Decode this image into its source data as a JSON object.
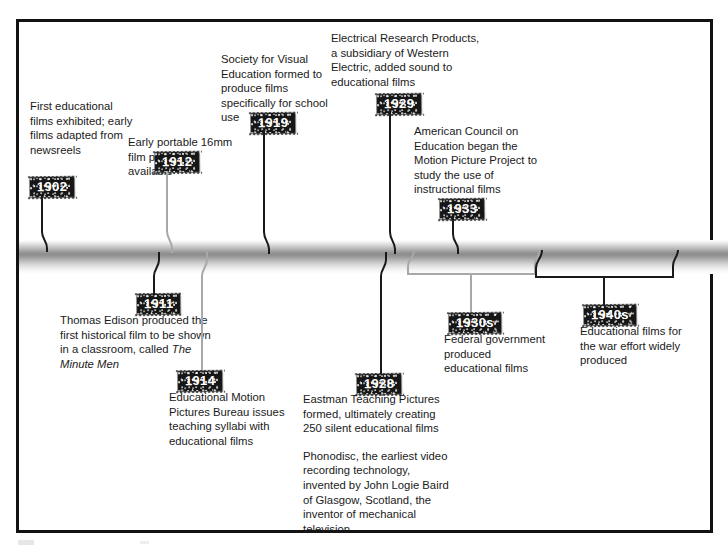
{
  "timeline": {
    "title": "History of Educational Film",
    "entries": [
      {
        "id": "1902",
        "year": "1902",
        "text": "First educational films exhibited; early films adapted from newsreels",
        "side": "above",
        "connector": "black",
        "marker": "point"
      },
      {
        "id": "1911",
        "year": "1911",
        "text": "Thomas Edison produced the first historical film to be shown in a classroom, called ",
        "text_italic": "The Minute Men",
        "side": "below",
        "connector": "black",
        "marker": "point"
      },
      {
        "id": "1912",
        "year": "1912",
        "text": "Early portable 16mm film projectors available",
        "side": "above",
        "connector": "gray",
        "marker": "point"
      },
      {
        "id": "1914",
        "year": "1914",
        "text": "Educational Motion Pictures Bureau issues teaching syllabi with educational films",
        "side": "below",
        "connector": "gray",
        "marker": "point"
      },
      {
        "id": "1919",
        "year": "1919",
        "text": "Society for Visual Education formed to produce films specifically for school use",
        "side": "above",
        "connector": "black",
        "marker": "point"
      },
      {
        "id": "1928",
        "year": "1928",
        "text": "Eastman Teaching Pictures formed, ultimately creating 250 silent educational films",
        "text2": "Phonodisc, the earliest video recording technology, invented by John Logie Baird of Glasgow, Scotland, the inventor of mechanical television",
        "side": "below",
        "connector": "black",
        "marker": "point"
      },
      {
        "id": "1929",
        "year": "1929",
        "text": "Electrical Research Products, a subsidiary of Western Electric, added sound to educational films",
        "side": "above",
        "connector": "black",
        "marker": "point"
      },
      {
        "id": "1933",
        "year": "1933",
        "text": "American Council on Education began the Motion Picture Project to study the use of instructional films",
        "side": "above",
        "connector": "black",
        "marker": "point"
      },
      {
        "id": "1930s",
        "year": "1930s",
        "text": "Federal government produced educational films",
        "side": "below",
        "connector": "gray",
        "marker": "span"
      },
      {
        "id": "1940s",
        "year": "1940s",
        "text": "Educational films for the war effort widely produced",
        "side": "below",
        "connector": "black",
        "marker": "span"
      }
    ]
  },
  "colors": {
    "connector_black": "#1a1a1a",
    "connector_gray": "#a8a8a8",
    "plaque_background": "#161616",
    "plaque_text": "#ffffff",
    "frame": "#121212",
    "text": "#1a1a1a"
  }
}
